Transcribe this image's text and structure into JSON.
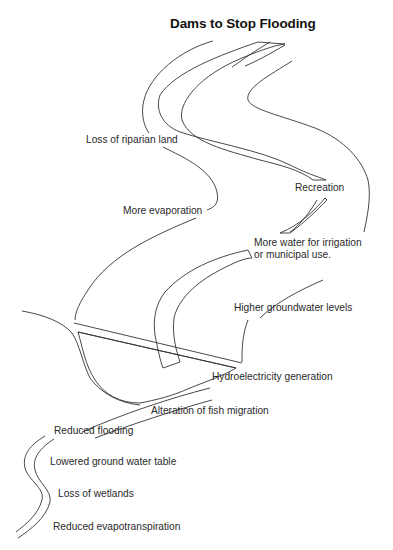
{
  "diagram": {
    "title": "Dams to Stop Flooding",
    "labels": {
      "riparian": "Loss of riparian land",
      "evaporation": "More evaporation",
      "recreation": "Recreation",
      "irrigation_1": "More water for irrigation",
      "irrigation_2": "or municipal use.",
      "groundwater": "Higher groundwater levels",
      "hydro": "Hydroelectricity generation",
      "fish": "Alteration of fish migration",
      "flooding": "Reduced flooding",
      "water_table": "Lowered ground water table",
      "wetlands": "Loss of wetlands",
      "evapotranspiration": "Reduced evapotranspiration"
    },
    "regions": {
      "upstream": "Reservoir (upstream of dam) — hatched water",
      "dam": "Dam wall",
      "below_dam": "Crosshatched spillway basin",
      "downstream": "Narrow downstream river"
    },
    "colors": {
      "line": "#333333",
      "text": "#2a2a2a",
      "background": "#ffffff"
    }
  }
}
